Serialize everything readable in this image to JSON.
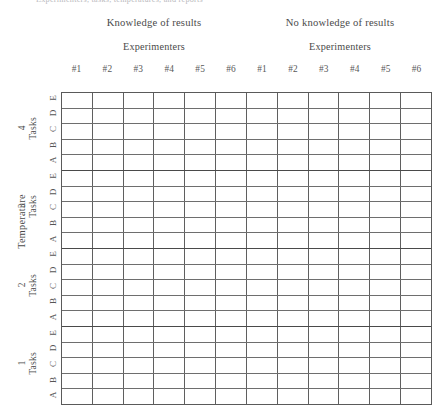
{
  "caption": {
    "text": "Experimenters, tasks, temperatures, and reports"
  },
  "column_groups": [
    {
      "title": "Knowledge of results",
      "subtitle": "Experimenters"
    },
    {
      "title": "No knowledge of results",
      "subtitle": "Experimenters"
    }
  ],
  "column_headers": [
    "#1",
    "#2",
    "#3",
    "#4",
    "#5",
    "#6",
    "#1",
    "#2",
    "#3",
    "#4",
    "#5",
    "#6"
  ],
  "row_axis": {
    "label": "Temperature",
    "group_sublabel": "Tasks"
  },
  "row_groups": [
    {
      "number": "4",
      "sublabel": "Tasks",
      "rows": [
        "E",
        "D",
        "C",
        "B",
        "A"
      ]
    },
    {
      "number": "3",
      "sublabel": "Tasks",
      "rows": [
        "E",
        "D",
        "C",
        "B",
        "A"
      ]
    },
    {
      "number": "2",
      "sublabel": "Tasks",
      "rows": [
        "E",
        "D",
        "C",
        "B",
        "A"
      ]
    },
    {
      "number": "1",
      "sublabel": "Tasks",
      "rows": [
        "E",
        "D",
        "C",
        "B",
        "A"
      ]
    }
  ],
  "grid": {
    "columns": 12,
    "rows": 20,
    "cell_values": [
      [
        "",
        "",
        "",
        "",
        "",
        "",
        "",
        "",
        "",
        "",
        "",
        ""
      ],
      [
        "",
        "",
        "",
        "",
        "",
        "",
        "",
        "",
        "",
        "",
        "",
        ""
      ],
      [
        "",
        "",
        "",
        "",
        "",
        "",
        "",
        "",
        "",
        "",
        "",
        ""
      ],
      [
        "",
        "",
        "",
        "",
        "",
        "",
        "",
        "",
        "",
        "",
        "",
        ""
      ],
      [
        "",
        "",
        "",
        "",
        "",
        "",
        "",
        "",
        "",
        "",
        "",
        ""
      ],
      [
        "",
        "",
        "",
        "",
        "",
        "",
        "",
        "",
        "",
        "",
        "",
        ""
      ],
      [
        "",
        "",
        "",
        "",
        "",
        "",
        "",
        "",
        "",
        "",
        "",
        ""
      ],
      [
        "",
        "",
        "",
        "",
        "",
        "",
        "",
        "",
        "",
        "",
        "",
        ""
      ],
      [
        "",
        "",
        "",
        "",
        "",
        "",
        "",
        "",
        "",
        "",
        "",
        ""
      ],
      [
        "",
        "",
        "",
        "",
        "",
        "",
        "",
        "",
        "",
        "",
        "",
        ""
      ],
      [
        "",
        "",
        "",
        "",
        "",
        "",
        "",
        "",
        "",
        "",
        "",
        ""
      ],
      [
        "",
        "",
        "",
        "",
        "",
        "",
        "",
        "",
        "",
        "",
        "",
        ""
      ],
      [
        "",
        "",
        "",
        "",
        "",
        "",
        "",
        "",
        "",
        "",
        "",
        ""
      ],
      [
        "",
        "",
        "",
        "",
        "",
        "",
        "",
        "",
        "",
        "",
        "",
        ""
      ],
      [
        "",
        "",
        "",
        "",
        "",
        "",
        "",
        "",
        "",
        "",
        "",
        ""
      ],
      [
        "",
        "",
        "",
        "",
        "",
        "",
        "",
        "",
        "",
        "",
        "",
        ""
      ],
      [
        "",
        "",
        "",
        "",
        "",
        "",
        "",
        "",
        "",
        "",
        "",
        ""
      ],
      [
        "",
        "",
        "",
        "",
        "",
        "",
        "",
        "",
        "",
        "",
        "",
        ""
      ],
      [
        "",
        "",
        "",
        "",
        "",
        "",
        "",
        "",
        "",
        "",
        "",
        ""
      ],
      [
        "",
        "",
        "",
        "",
        "",
        "",
        "",
        "",
        "",
        "",
        "",
        ""
      ]
    ]
  },
  "colors": {
    "page_background": "#ffffff",
    "grid_line": "#5f5f5f",
    "group_separator": "#4a4a4a",
    "text": "#4a4a4a",
    "caption_text": "#b9b9bd"
  }
}
